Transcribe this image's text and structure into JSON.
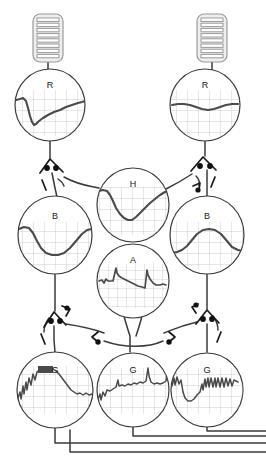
{
  "diagram": {
    "background_color": "#ffffff",
    "line_color": "#3a3a3a",
    "trace_color": "#4a4a4a",
    "grid_color": "#b9b9b9",
    "stripe_fill": "#e8e8e8",
    "stripe_stroke": "#9a9a9a"
  },
  "inputs": [
    {
      "name": "striped-block-left",
      "x": 33,
      "y": 14,
      "w": 30,
      "h": 48,
      "stripes": 9
    },
    {
      "name": "striped-block-right",
      "x": 197,
      "y": 14,
      "w": 30,
      "h": 48,
      "stripes": 9
    }
  ],
  "nodes": [
    {
      "id": "r-left",
      "label": "R",
      "cx": 50,
      "cy": 105,
      "rx": 35,
      "ry": 36
    },
    {
      "id": "r-right",
      "label": "R",
      "cx": 205,
      "cy": 105,
      "rx": 35,
      "ry": 36
    },
    {
      "id": "h-mid",
      "label": "H",
      "cx": 133,
      "cy": 205,
      "rx": 36,
      "ry": 37
    },
    {
      "id": "b-left",
      "label": "B",
      "cx": 55,
      "cy": 235,
      "rx": 37,
      "ry": 39
    },
    {
      "id": "b-right",
      "label": "B",
      "cx": 207,
      "cy": 235,
      "rx": 37,
      "ry": 39
    },
    {
      "id": "a-mid",
      "label": "A",
      "cx": 133,
      "cy": 281,
      "rx": 36,
      "ry": 37
    },
    {
      "id": "g-left",
      "label": "G",
      "cx": 55,
      "cy": 390,
      "rx": 38,
      "ry": 38
    },
    {
      "id": "g-mid",
      "label": "G",
      "cx": 133,
      "cy": 390,
      "rx": 36,
      "ry": 37
    },
    {
      "id": "g-right",
      "label": "G",
      "cx": 207,
      "cy": 390,
      "rx": 36,
      "ry": 37
    }
  ],
  "traces": {
    "r-left": "M 16,100 L 20,99 L 23,98 L 26,101 L 28,108 L 30,116 L 32,122 L 34,125 L 36,124 L 39,121 L 43,118 L 48,115 L 54,112 L 60,110 L 66,107 L 72,105 L 78,103 L 82,102 L 85,101",
    "r-right": "M 172,105 L 178,104 L 184,104 L 190,105 L 196,107 L 202,109 L 208,110 L 214,109 L 220,107 L 226,105 L 232,104 L 238,104",
    "h-mid": "M 99,191 L 103,190 L 107,191 L 110,195 L 113,201 L 116,208 L 120,214 L 124,218 L 128,220 L 132,220 L 136,217 L 140,213 L 145,208 L 150,203 L 155,199 L 160,195 L 165,192 L 168,191",
    "b-left": "M 19,229 L 24,227 L 29,228 L 33,233 L 37,241 L 41,248 L 46,253 L 52,255 L 58,255 L 64,253 L 70,248 L 76,241 L 82,234 L 87,230 L 92,229",
    "b-right": "M 171,253 L 177,252 L 182,250 L 187,246 L 192,240 L 197,234 L 203,230 L 209,229 L 215,230 L 221,234 L 227,241 L 232,247 L 238,250 L 243,251",
    "a-mid": "M 99,281 L 102,280 L 104,283 L 106,279 L 108,281 L 110,281 L 113,281 L 116,268 L 117,273 L 119,276 L 122,278 L 126,280 L 130,282 L 134,284 L 138,286 L 142,287 L 145,288 L 147,270 L 148,275 L 150,279 L 153,283 L 156,285 L 160,285 L 163,284 L 166,285",
    "g-left": "M 18,398 L 20,392 L 21,399 L 23,386 L 24,394 L 26,382 L 27,390 L 29,378 L 31,385 L 33,374 L 35,380 L 37,372 L 39,370 L 41,368 L 44,368 L 47,368 L 50,368 L 53,369 L 56,371 L 59,374 L 62,378 L 65,382 L 68,386 L 71,390 L 74,392 L 77,394 L 80,393 L 83,395 L 86,393 L 89,395 L 92,394",
    "g-mid": "M 98,399 L 100,394 L 101,400 L 103,392 L 105,396 L 107,390 L 110,391 L 113,389 L 116,387 L 118,380 L 119,386 L 122,385 L 125,386 L 128,384 L 131,385 L 134,383 L 137,384 L 140,382 L 143,383 L 146,381 L 148,368 L 149,376 L 151,382 L 154,384 L 157,383 L 160,384 L 163,383 L 166,381 L 167,373 L 168,380",
    "g-right": "M 172,386 L 174,378 L 175,385 L 177,377 L 179,384 L 181,380 L 183,392 L 185,398 L 188,401 L 191,401 L 194,399 L 197,395 L 200,392 L 202,384 L 203,390 L 205,379 L 206,387 L 208,378 L 209,387 L 211,378 L 213,387 L 215,378 L 216,387 L 218,378 L 220,387 L 222,378 L 224,387 L 226,378 L 228,386 L 230,379 L 232,386 L 234,380 L 238,382",
    "notes": "hand-traced oscilloscope waveforms"
  },
  "connections": [
    {
      "from": "striped-block-left",
      "to": "r-left",
      "name": "link-input-left"
    },
    {
      "from": "striped-block-right",
      "to": "r-right",
      "name": "link-input-right"
    },
    {
      "from": "r-left",
      "to": "b-left",
      "name": "link-r-left-to-b-left"
    },
    {
      "from": "r-right",
      "to": "b-right",
      "name": "link-r-right-to-b-right"
    },
    {
      "from": "r-left",
      "to": "h-mid",
      "name": "link-r-left-to-h"
    },
    {
      "from": "r-right",
      "to": "h-mid",
      "name": "link-r-right-to-h"
    },
    {
      "from": "b-left",
      "to": "g-left",
      "name": "link-b-left-to-g-left"
    },
    {
      "from": "b-right",
      "to": "g-right",
      "name": "link-b-right-to-g-right"
    },
    {
      "from": "a-mid",
      "to": "g-mid",
      "name": "link-a-to-g-mid"
    },
    {
      "from": "g-left",
      "to": "output-bus",
      "name": "link-g-left-out"
    },
    {
      "from": "g-mid",
      "to": "output-bus",
      "name": "link-g-mid-out"
    },
    {
      "from": "g-right",
      "to": "output-bus",
      "name": "link-g-right-out"
    }
  ],
  "synapses": [
    {
      "name": "synapse-left-upper",
      "x": 54,
      "y": 165
    },
    {
      "name": "synapse-right-upper",
      "x": 205,
      "y": 163
    },
    {
      "name": "synapse-left-lower",
      "x": 56,
      "y": 318
    },
    {
      "name": "synapse-right-lower",
      "x": 208,
      "y": 316
    },
    {
      "name": "synapse-mid-left",
      "x": 99,
      "y": 330
    },
    {
      "name": "synapse-mid-right",
      "x": 168,
      "y": 330
    }
  ],
  "outputs": [
    {
      "name": "output-line-1",
      "y": 440
    },
    {
      "name": "output-line-2",
      "y": 448
    },
    {
      "name": "output-line-3",
      "y": 456
    }
  ]
}
